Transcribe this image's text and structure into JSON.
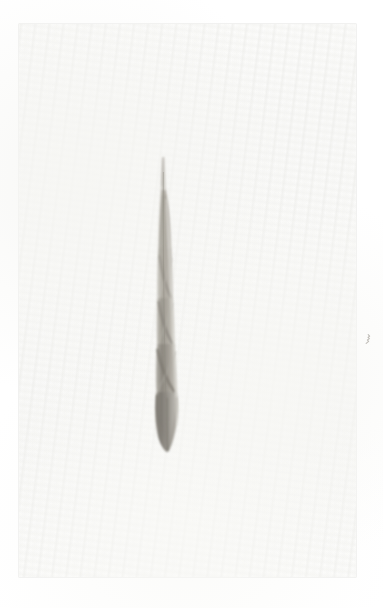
{
  "image": {
    "kind": "herbarium-specimen-scan",
    "subject_label": "dried grass leaf blade",
    "caption": "Single narrow twisted grass blade mounted on pale paper sheet",
    "width_px": 383,
    "height_px": 608,
    "orientation": "portrait"
  },
  "background": {
    "canvas_color": "#ffffff",
    "paper_color": "#fafaf9",
    "paper_edge_color": "#e2e2e0",
    "paper_left_px": 19,
    "paper_top_px": 24,
    "paper_width_px": 337,
    "paper_height_px": 553
  },
  "specimen": {
    "name": "grass-blade",
    "bounding_box": {
      "x": 151,
      "y": 156,
      "width": 31,
      "height": 296
    },
    "tip_point": {
      "x": 163,
      "y": 157
    },
    "base_point": {
      "x": 168,
      "y": 451
    },
    "widest_point": {
      "x": 168,
      "y": 412,
      "width_px": 24
    },
    "palette": {
      "lightest": "#dedcd6",
      "light": "#c8c6bf",
      "mid": "#ada9a0",
      "dark": "#8e8a82",
      "darkest": "#6f6b64"
    },
    "segments": [
      {
        "name": "awn-tip",
        "y_from": 156,
        "y_to": 198,
        "tone": "#c9c7c0"
      },
      {
        "name": "upper-blade",
        "y_from": 198,
        "y_to": 258,
        "tone": "#b4b0a8"
      },
      {
        "name": "upper-twist",
        "y_from": 258,
        "y_to": 300,
        "tone": "#b9b5ad"
      },
      {
        "name": "mid-blade",
        "y_from": 300,
        "y_to": 345,
        "tone": "#a8a49b"
      },
      {
        "name": "lower-twist",
        "y_from": 345,
        "y_to": 392,
        "tone": "#9a968d"
      },
      {
        "name": "basal-lamina",
        "y_from": 392,
        "y_to": 452,
        "tone": "#8e8a82"
      }
    ]
  },
  "marks": [
    {
      "name": "faint-ink-fleck",
      "x": 363,
      "y": 330,
      "width": 9,
      "height": 10,
      "color": "#b9b6b0"
    }
  ],
  "annotations": {
    "text_present": false,
    "labels": []
  }
}
